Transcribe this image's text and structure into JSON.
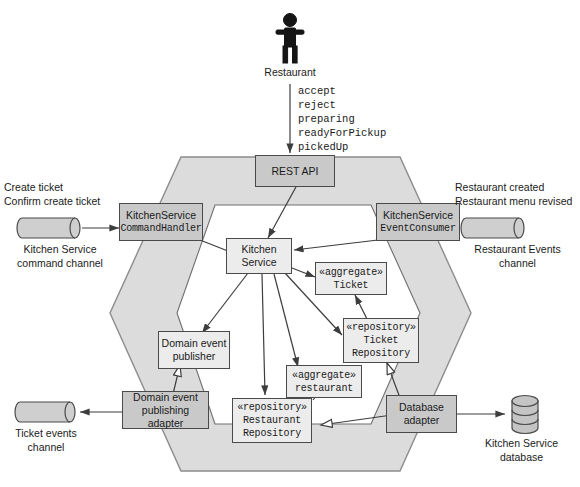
{
  "diagram": {
    "colors": {
      "outer_hexagon_fill": "#dcdcdc",
      "inner_hexagon_fill": "#ffffff",
      "adapter_fill": "#c9c9c9",
      "domain_fill": "#ececec",
      "stroke": "#4a4a4a",
      "text": "#1a1a1a"
    }
  },
  "actor": {
    "name": "Restaurant",
    "icon": "person-actor-icon"
  },
  "operations": {
    "items": [
      "accept",
      "reject",
      "preparing",
      "readyForPickup",
      "pickedUp"
    ],
    "text": "accept\nreject\npreparing\nreadyForPickup\npickedUp"
  },
  "adapters": {
    "rest_api": {
      "label": "REST API"
    },
    "command_handler": {
      "line1": "KitchenService",
      "line2": "CommandHandler"
    },
    "event_consumer": {
      "line1": "KitchenService",
      "line2": "EventConsumer"
    },
    "event_publishing_adapter": {
      "line1": "Domain event",
      "line2": "publishing adapter"
    },
    "database_adapter": {
      "line1": "Database",
      "line2": "adapter"
    }
  },
  "domain": {
    "kitchen_service": {
      "line1": "Kitchen",
      "line2": "Service"
    },
    "ticket_aggregate": {
      "stereotype": "«aggregate»",
      "name": "Ticket"
    },
    "restaurant_aggregate": {
      "stereotype": "«aggregate»",
      "name": "restaurant"
    },
    "ticket_repository": {
      "stereotype": "«repository»",
      "line1": "Ticket",
      "line2": "Repository"
    },
    "restaurant_repository": {
      "stereotype": "«repository»",
      "line1": "Restaurant",
      "line2": "Repository"
    },
    "domain_event_publisher": {
      "line1": "Domain event",
      "line2": "publisher"
    }
  },
  "channels": {
    "command_channel": {
      "messages": "Create ticket\nConfirm create ticket",
      "caption": "Kitchen Service\ncommand channel",
      "icon": "message-channel-icon"
    },
    "restaurant_events_channel": {
      "messages": "Restaurant created\nRestaurant menu revised",
      "caption": "Restaurant Events\nchannel",
      "icon": "message-channel-icon"
    },
    "ticket_events_channel": {
      "caption": "Ticket events\nchannel",
      "icon": "message-channel-icon"
    }
  },
  "datastore": {
    "kitchen_service_database": {
      "caption": "Kitchen Service\ndatabase",
      "icon": "database-cylinder-icon"
    }
  }
}
